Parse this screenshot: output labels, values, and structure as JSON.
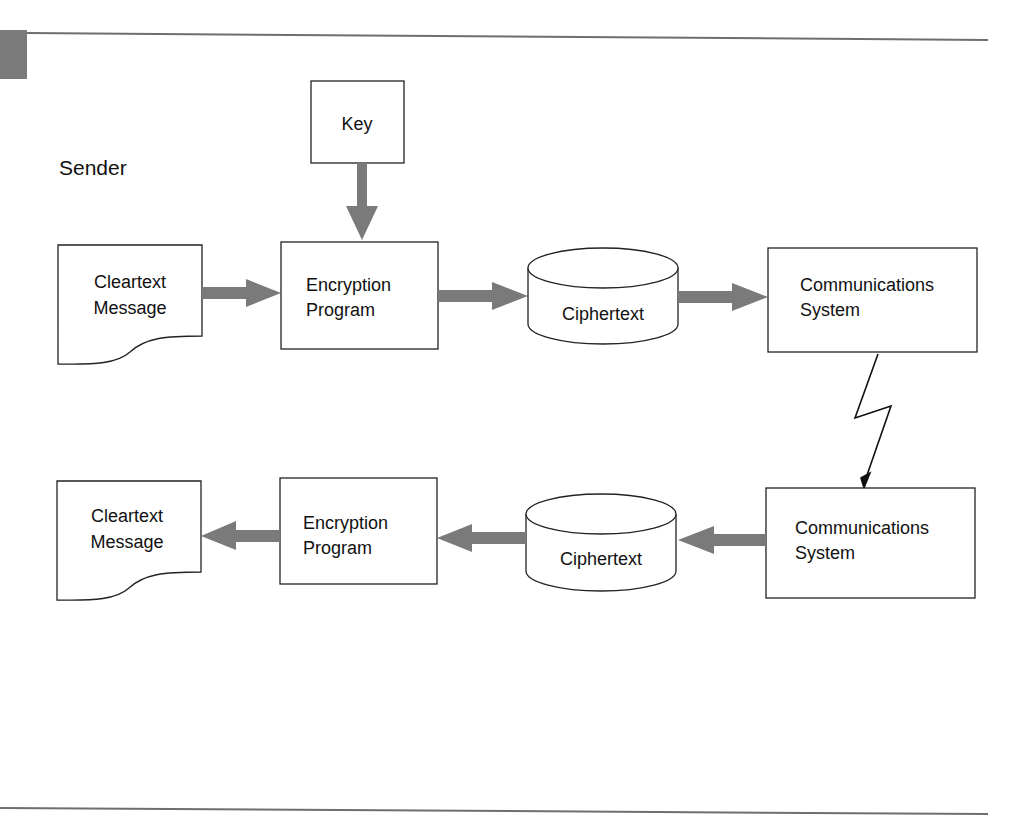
{
  "colors": {
    "arrow": "#7a7a7a",
    "stroke": "#222222",
    "rule": "#6e6e6e",
    "tab": "#7a7a7a",
    "background": "#ffffff"
  },
  "sender": {
    "label": "Sender",
    "key": {
      "label": "Key"
    },
    "cleartext": {
      "line1": "Cleartext",
      "line2": "Message"
    },
    "program": {
      "line1": "Encryption",
      "line2": "Program"
    },
    "ciphertext": {
      "label": "Ciphertext"
    },
    "comms": {
      "line1": "Communications",
      "line2": "System"
    }
  },
  "receiver": {
    "label": "Receiver",
    "key": {
      "label": "Key"
    },
    "cleartext": {
      "line1": "Cleartext",
      "line2": "Message"
    },
    "program": {
      "line1": "Encryption",
      "line2": "Program"
    },
    "ciphertext": {
      "label": "Ciphertext"
    },
    "comms": {
      "line1": "Communications",
      "line2": "System"
    }
  },
  "flows": [
    {
      "from": "sender.key",
      "to": "sender.program",
      "style": "thick-gray"
    },
    {
      "from": "sender.cleartext",
      "to": "sender.program",
      "style": "thick-gray"
    },
    {
      "from": "sender.program",
      "to": "sender.ciphertext",
      "style": "thick-gray"
    },
    {
      "from": "sender.ciphertext",
      "to": "sender.comms",
      "style": "thick-gray"
    },
    {
      "from": "sender.comms",
      "to": "receiver.comms",
      "style": "lightning"
    },
    {
      "from": "receiver.comms",
      "to": "receiver.ciphertext",
      "style": "thick-gray"
    },
    {
      "from": "receiver.ciphertext",
      "to": "receiver.program",
      "style": "thick-gray"
    },
    {
      "from": "receiver.program",
      "to": "receiver.cleartext",
      "style": "thick-gray"
    },
    {
      "from": "receiver.key",
      "to": "receiver.program",
      "style": "thick-gray"
    }
  ]
}
